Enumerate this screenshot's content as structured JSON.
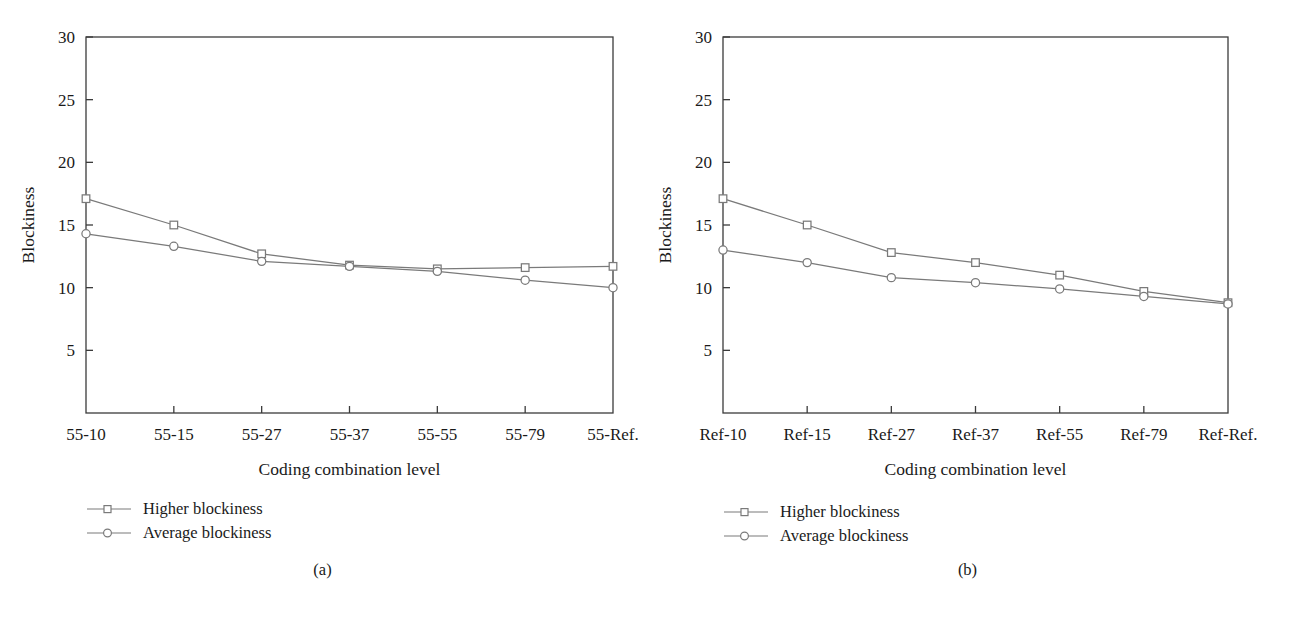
{
  "figure": {
    "panels": [
      {
        "caption": "(a)",
        "chart_data": {
          "type": "line",
          "title": "",
          "xlabel": "Coding combination level",
          "ylabel": "Blockiness",
          "categories": [
            "55-10",
            "55-15",
            "55-27",
            "55-37",
            "55-55",
            "55-79",
            "55-Ref."
          ],
          "ylim": [
            0,
            30
          ],
          "yticks": [
            5,
            10,
            15,
            20,
            25,
            30
          ],
          "grid": false,
          "legend_position": "below-left",
          "series": [
            {
              "name": "Higher blockiness",
              "marker": "square",
              "color": "#7a7a7a",
              "values": [
                17.1,
                15.0,
                12.7,
                11.8,
                11.5,
                11.6,
                11.7
              ]
            },
            {
              "name": "Average blockiness",
              "marker": "circle",
              "color": "#7a7a7a",
              "values": [
                14.3,
                13.3,
                12.1,
                11.7,
                11.3,
                10.6,
                10.0
              ]
            }
          ]
        }
      },
      {
        "caption": "(b)",
        "chart_data": {
          "type": "line",
          "title": "",
          "xlabel": "Coding combination level",
          "ylabel": "Blockiness",
          "categories": [
            "Ref-10",
            "Ref-15",
            "Ref-27",
            "Ref-37",
            "Ref-55",
            "Ref-79",
            "Ref-Ref."
          ],
          "ylim": [
            0,
            30
          ],
          "yticks": [
            5,
            10,
            15,
            20,
            25,
            30
          ],
          "grid": false,
          "legend_position": "below-left",
          "series": [
            {
              "name": "Higher blockiness",
              "marker": "square",
              "color": "#7a7a7a",
              "values": [
                17.1,
                15.0,
                12.8,
                12.0,
                11.0,
                9.7,
                8.8
              ]
            },
            {
              "name": "Average blockiness",
              "marker": "circle",
              "color": "#7a7a7a",
              "values": [
                13.0,
                12.0,
                10.8,
                10.4,
                9.9,
                9.3,
                8.7
              ]
            }
          ]
        }
      }
    ]
  },
  "colors": {
    "axis": "#3b3b3b",
    "line": "#7a7a7a",
    "text": "#1a1a1a"
  }
}
